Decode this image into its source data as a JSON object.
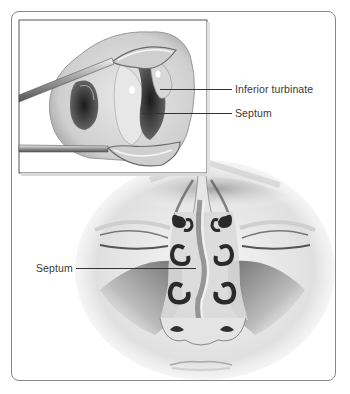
{
  "figure": {
    "inset": {
      "description": "Nostril held open by nasal speculum",
      "labels": [
        {
          "text": "Inferior turbinate"
        },
        {
          "text": "Septum"
        }
      ]
    },
    "main": {
      "description": "Frontal cross-section of face showing nasal passages",
      "labels": [
        {
          "text": "Septum"
        }
      ]
    },
    "colors": {
      "border": "#8a8a8a",
      "leader_line": "#333333",
      "label_text": "#3a3a3a",
      "background": "#ffffff"
    }
  }
}
